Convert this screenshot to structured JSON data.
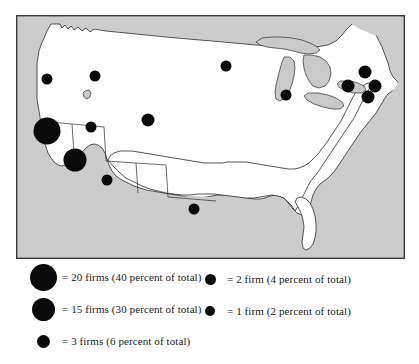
{
  "figure": {
    "kind": "dot-distribution-map",
    "region": "continental-united-states"
  },
  "map": {
    "frame": {
      "x": 0,
      "y": 0,
      "width": 389,
      "height": 244
    },
    "colors": {
      "land": "#ffffff",
      "outside": "#cccccc",
      "lake": "#c9c9c9",
      "outline": "#2b2b2b",
      "dot": "#0a0a0a"
    },
    "dots": [
      {
        "name": "dot-pacific-northwest",
        "cx": 31,
        "cy": 64,
        "r": 5.5,
        "firms": 2
      },
      {
        "name": "dot-northern-rockies",
        "cx": 79,
        "cy": 61,
        "r": 5.5,
        "firms": 2
      },
      {
        "name": "dot-upper-midwest",
        "cx": 210,
        "cy": 51,
        "r": 5.5,
        "firms": 2
      },
      {
        "name": "dot-northern-california",
        "cx": 31,
        "cy": 116,
        "r": 13.5,
        "firms": 20
      },
      {
        "name": "dot-mountain-west",
        "cx": 75,
        "cy": 112,
        "r": 5.5,
        "firms": 2
      },
      {
        "name": "dot-great-plains",
        "cx": 132,
        "cy": 105,
        "r": 6.5,
        "firms": 3
      },
      {
        "name": "dot-southern-california",
        "cx": 59,
        "cy": 145,
        "r": 11.5,
        "firms": 15
      },
      {
        "name": "dot-southwest",
        "cx": 91,
        "cy": 165,
        "r": 5.5,
        "firms": 2
      },
      {
        "name": "dot-midwest-plains",
        "cx": 270,
        "cy": 80,
        "r": 5.5,
        "firms": 2
      },
      {
        "name": "dot-central-plains",
        "cx": 178,
        "cy": 194,
        "r": 5.5,
        "firms": 2
      },
      {
        "name": "dot-upstate-northeast",
        "cx": 349,
        "cy": 57,
        "r": 6.5,
        "firms": 3
      },
      {
        "name": "dot-great-lakes-east",
        "cx": 332,
        "cy": 71,
        "r": 6.5,
        "firms": 3
      },
      {
        "name": "dot-new-england",
        "cx": 359,
        "cy": 71,
        "r": 6.5,
        "firms": 3
      },
      {
        "name": "dot-mid-atlantic",
        "cx": 352,
        "cy": 82,
        "r": 6.5,
        "firms": 3
      }
    ]
  },
  "legend": {
    "items": [
      {
        "id": "legend-20-firms",
        "column": "left",
        "radius": 13.5,
        "label": "= 20 firms (40 percent of total)",
        "firms": 20,
        "percent": 40
      },
      {
        "id": "legend-15-firms",
        "column": "left",
        "radius": 11.5,
        "label": "= 15 firms (30 percent of total)",
        "firms": 15,
        "percent": 30
      },
      {
        "id": "legend-3-firms",
        "column": "left",
        "radius": 6.5,
        "label": "= 3 firms (6 percent of total)",
        "firms": 3,
        "percent": 6
      },
      {
        "id": "legend-2-firms",
        "column": "right",
        "radius": 5.5,
        "label": "= 2 firm (4 percent of total)",
        "firms": 2,
        "percent": 4
      },
      {
        "id": "legend-1-firm",
        "column": "right",
        "radius": 5,
        "label": "= 1 firm (2 percent of total)",
        "firms": 1,
        "percent": 2
      }
    ]
  }
}
